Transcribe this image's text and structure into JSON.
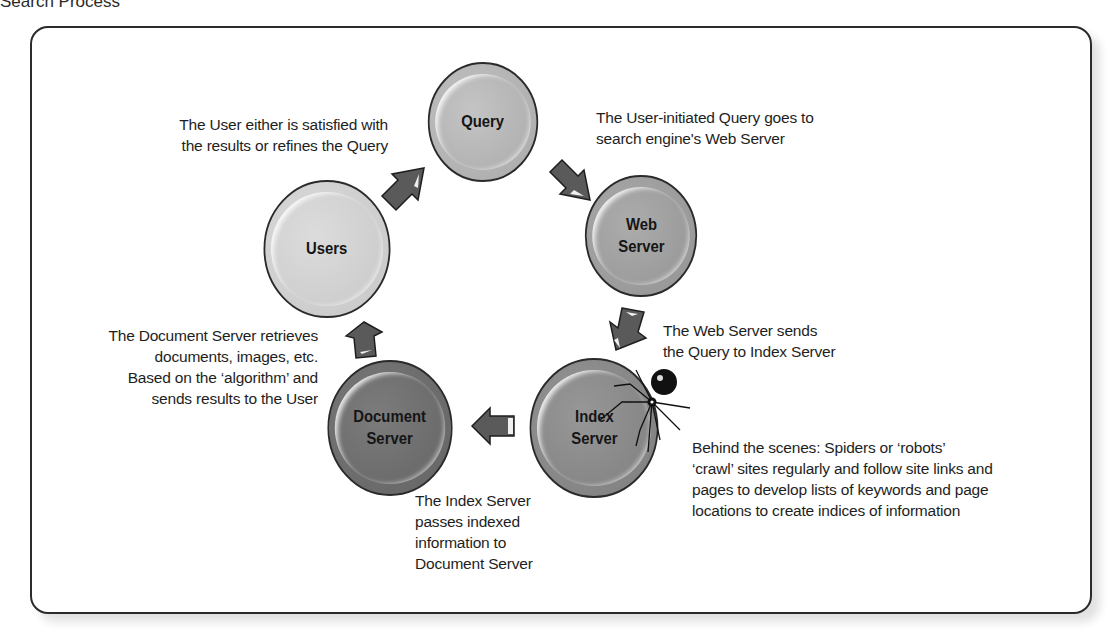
{
  "page": {
    "title": "Search Process"
  },
  "colors": {
    "query": "#b4b4b4",
    "web_server": "#9e9e9e",
    "index_server": "#8a8a8a",
    "document_server": "#6e6e6e",
    "users": "#d2d2d2",
    "arrow": "#5a5a5a",
    "outline": "#2a2a2a"
  },
  "nodes": {
    "query": {
      "label": "Query"
    },
    "web_server": {
      "label": "Web\nServer"
    },
    "index_server": {
      "label": "Index\nServer"
    },
    "document_server": {
      "label": "Document\nServer"
    },
    "users": {
      "label": "Users"
    }
  },
  "annotations": {
    "users_to_query": "The User either is satisfied with\nthe results or refines the Query",
    "query_to_web": "The User-initiated Query goes to\nsearch engine's Web Server",
    "web_to_index": "The Web Server sends\nthe Query to Index Server",
    "doc_to_users": "The Document Server retrieves\ndocuments, images, etc.\nBased on the ‘algorithm’ and\nsends results to the User",
    "index_to_doc": "The Index Server\npasses indexed\ninformation to\nDocument Server",
    "spiders": "Behind the scenes: Spiders or ‘robots’\n‘crawl’ sites regularly and follow site links and\npages to develop lists of keywords and page\nlocations to create indices of information"
  },
  "arrows": [
    {
      "from": "users",
      "to": "query",
      "direction": "up-right"
    },
    {
      "from": "query",
      "to": "web_server",
      "direction": "down-right"
    },
    {
      "from": "web_server",
      "to": "index_server",
      "direction": "down-left"
    },
    {
      "from": "index_server",
      "to": "document_server",
      "direction": "left"
    },
    {
      "from": "document_server",
      "to": "users",
      "direction": "up"
    }
  ],
  "icons": {
    "spider": "spider-icon"
  }
}
